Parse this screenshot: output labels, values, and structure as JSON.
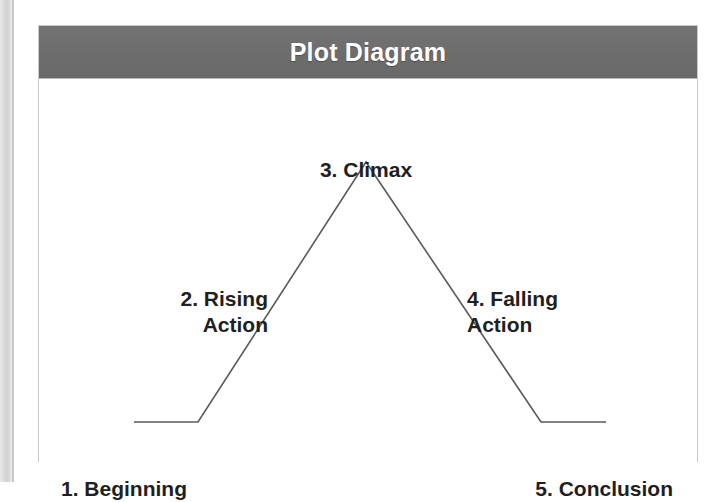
{
  "page": {
    "background_color": "#ffffff",
    "edge_strip_color": "#d4d4d4"
  },
  "card": {
    "border_color": "#c9c9c9",
    "background_color": "#ffffff"
  },
  "header": {
    "title": "Plot Diagram",
    "background_color": "#6f6f6f",
    "text_color": "#ffffff"
  },
  "diagram": {
    "line_color": "#5a5a5a",
    "line_width": 1.6,
    "label_color": "#1f1f1f",
    "labels": {
      "climax": "3. Climax",
      "rising_action": "2. Rising\nAction",
      "falling_action": "4. Falling\nAction",
      "beginning": "1. Beginning",
      "conclusion": "5. Conclusion"
    }
  },
  "chart_data": {
    "type": "line",
    "title": "Plot Diagram",
    "xlabel": "",
    "ylabel": "",
    "grid": false,
    "legend": "none",
    "xlim": [
      0,
      660
    ],
    "ylim": [
      0,
      383
    ],
    "annotations": [
      {
        "name": "beginning",
        "text": "1. Beginning",
        "stage": 1,
        "x": 22,
        "y": 397
      },
      {
        "name": "rising-action",
        "text": "2. Rising Action",
        "stage": 2,
        "x": 145,
        "y": 215
      },
      {
        "name": "climax",
        "text": "3. Climax",
        "stage": 3,
        "x": 330,
        "y": 88
      },
      {
        "name": "falling-action",
        "text": "4. Falling Action",
        "stage": 4,
        "x": 515,
        "y": 215
      },
      {
        "name": "conclusion",
        "text": "5. Conclusion",
        "stage": 5,
        "x": 636,
        "y": 397
      }
    ],
    "series": [
      {
        "name": "narrative-arc",
        "points": [
          {
            "x": 95,
            "y": 18
          },
          {
            "x": 159,
            "y": 18
          },
          {
            "x": 327,
            "y": 278
          },
          {
            "x": 502,
            "y": 18
          },
          {
            "x": 567,
            "y": 18
          }
        ]
      }
    ],
    "path_points_screen": [
      [
        95,
        343
      ],
      [
        159,
        343
      ],
      [
        327,
        83
      ],
      [
        502,
        343
      ],
      [
        567,
        343
      ]
    ]
  }
}
